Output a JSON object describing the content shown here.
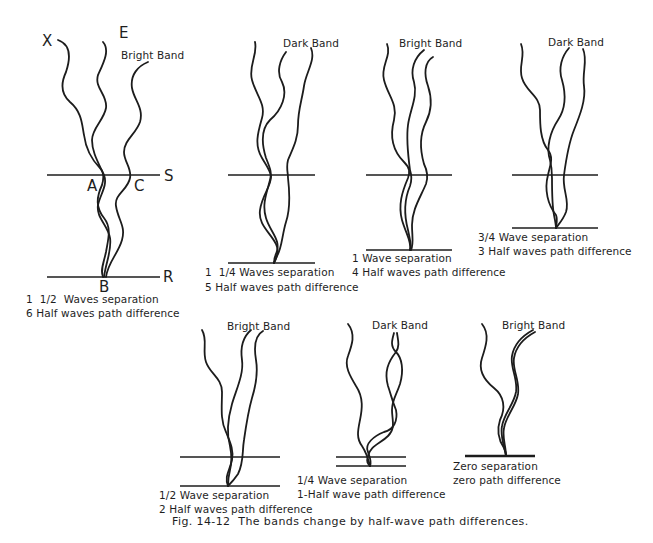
{
  "figure": {
    "caption": "Fig. 14-12  The bands change by half-wave path differences.",
    "panels": [
      {
        "band": "Bright Band",
        "point_labels": {
          "source": "X",
          "top": "E",
          "surface": "S",
          "reflector": "R",
          "a": "A",
          "c": "C",
          "b": "B"
        },
        "separation": "1  1/2  Waves separation",
        "path_difference": "6 Half waves path difference"
      },
      {
        "band": "Dark Band",
        "separation": "1  1/4 Waves separation",
        "path_difference": "5 Half waves path difference"
      },
      {
        "band": "Bright Band",
        "separation": "1 Wave separation",
        "path_difference": "4 Half waves path difference"
      },
      {
        "band": "Dark Band",
        "separation": "3/4 Wave separation",
        "path_difference": "3 Half waves path difference"
      },
      {
        "band": "Bright Band",
        "separation": "1/2 Wave separation",
        "path_difference": "2 Half waves path difference"
      },
      {
        "band": "Dark Band",
        "separation": "1/4 Wave separation",
        "path_difference": "1-Half wave path difference"
      },
      {
        "band": "Bright Band",
        "separation": "Zero separation",
        "path_difference": "zero path difference"
      }
    ]
  }
}
